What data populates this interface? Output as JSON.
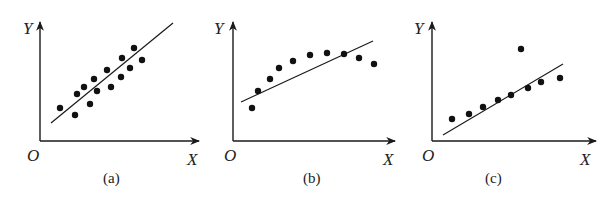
{
  "chart_data": [
    {
      "type": "scatter",
      "caption": "(a)",
      "xlabel": "X",
      "ylabel": "Y",
      "origin_label": "O",
      "grid": false,
      "trend_line": true,
      "description": "Points scattered closely around an increasing regression line (strong positive linear correlation)",
      "points_px": [
        [
          60,
          108
        ],
        [
          75,
          115
        ],
        [
          77,
          94
        ],
        [
          84,
          87
        ],
        [
          90,
          104
        ],
        [
          94,
          79
        ],
        [
          97,
          91
        ],
        [
          107,
          70
        ],
        [
          111,
          87
        ],
        [
          121,
          77
        ],
        [
          122,
          58
        ],
        [
          130,
          68
        ],
        [
          134,
          48
        ],
        [
          142,
          60
        ]
      ],
      "line_px": [
        [
          51,
          123
        ],
        [
          173,
          23
        ]
      ]
    },
    {
      "type": "scatter",
      "caption": "(b)",
      "xlabel": "X",
      "ylabel": "Y",
      "origin_label": "O",
      "grid": false,
      "trend_line": true,
      "description": "Points follow a curved (concave) pattern; linear fit line is a poor model",
      "points_px": [
        [
          252,
          108
        ],
        [
          258,
          91
        ],
        [
          270,
          79
        ],
        [
          279,
          68
        ],
        [
          293,
          61
        ],
        [
          310,
          55
        ],
        [
          327,
          53
        ],
        [
          344,
          54
        ],
        [
          359,
          58
        ],
        [
          374,
          64
        ]
      ],
      "line_px": [
        [
          241,
          102
        ],
        [
          373,
          41
        ]
      ]
    },
    {
      "type": "scatter",
      "caption": "(c)",
      "xlabel": "X",
      "ylabel": "Y",
      "origin_label": "O",
      "grid": false,
      "trend_line": true,
      "description": "Points lie near an increasing line except for one outlier well above the line",
      "points_px": [
        [
          452,
          119
        ],
        [
          469,
          114
        ],
        [
          483,
          107
        ],
        [
          498,
          100
        ],
        [
          511,
          95
        ],
        [
          521,
          49
        ],
        [
          528,
          88
        ],
        [
          541,
          82
        ],
        [
          560,
          78
        ]
      ],
      "line_px": [
        [
          443,
          135
        ],
        [
          563,
          64
        ]
      ]
    }
  ],
  "panels": [
    {
      "caption": "(a)",
      "x_label": "X",
      "y_label": "Y",
      "origin": "O"
    },
    {
      "caption": "(b)",
      "x_label": "X",
      "y_label": "Y",
      "origin": "O"
    },
    {
      "caption": "(c)",
      "x_label": "X",
      "y_label": "Y",
      "origin": "O"
    }
  ]
}
